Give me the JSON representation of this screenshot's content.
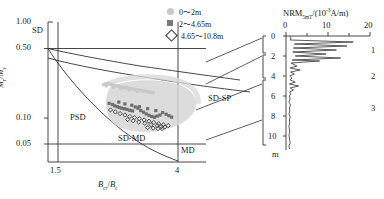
{
  "figure": {
    "panels": [
      "day-plot",
      "nrm-depth-log"
    ]
  },
  "day_plot": {
    "ylabel_m": "M",
    "ylabel_r": "r",
    "ylabel_slash": "/",
    "ylabel_m2": "M",
    "ylabel_s": "s",
    "xlabel_b": "B",
    "xlabel_cr": "cr",
    "xlabel_slash": "/",
    "xlabel_b2": "B",
    "xlabel_c": "c",
    "y_ticks": [
      "1.00",
      "0.50",
      "0.10",
      "0.05"
    ],
    "x_ticks": [
      "1.5",
      "4"
    ],
    "regions": {
      "sd": "SD",
      "psd": "PSD",
      "md": "MD",
      "sd_md": "SD-MD",
      "sd_sp": "SD-SP"
    },
    "ylim": [
      0.03,
      1.25
    ],
    "xlim": [
      1.0,
      5.6
    ],
    "boundary_lines": {
      "y_050": 0.5,
      "y_005": 0.05,
      "x_15": 1.5,
      "x_4": 4.0
    }
  },
  "legend": {
    "items": [
      {
        "marker": "filled-circle",
        "color": "#c9c9c9",
        "label": "0～2m"
      },
      {
        "marker": "filled-square",
        "color": "#7a7a7a",
        "label": "2～4.65m"
      },
      {
        "marker": "open-diamond",
        "color": "#333333",
        "label": "4.65～10.8m"
      }
    ]
  },
  "nrm_panel": {
    "title_main": "NRM",
    "title_sub": "5mT",
    "title_rest_open": "/(10",
    "title_exp": "-3",
    "title_rest_close": "A/m)",
    "x_ticks": [
      "0",
      "10",
      "20"
    ],
    "xlim": [
      0,
      20
    ],
    "depth_ticks": [
      "0",
      "2",
      "4",
      "6",
      "8",
      "10"
    ],
    "depth_unit": "m",
    "ylim": [
      0,
      11.4
    ],
    "zones": [
      {
        "label": "1",
        "depth_range": [
          0,
          2
        ]
      },
      {
        "label": "2",
        "depth_range": [
          2,
          4.65
        ]
      },
      {
        "label": "3",
        "depth_range": [
          4.65,
          10.8
        ]
      }
    ]
  },
  "chart_data": {
    "type": "scatter",
    "title": "",
    "xlabel": "Bcr/Bc",
    "ylabel": "Mr/Ms",
    "xlim": [
      1.0,
      5.6
    ],
    "ylim": [
      0.03,
      1.25
    ],
    "yscale": "log",
    "grid": false,
    "legend_position": "top-right",
    "series": [
      {
        "name": "0～2m",
        "color": "#c9c9c9",
        "marker": "filled-circle",
        "points": [
          [
            2.62,
            0.236
          ],
          [
            2.68,
            0.24
          ],
          [
            2.74,
            0.243
          ],
          [
            2.8,
            0.239
          ],
          [
            2.86,
            0.234
          ],
          [
            2.92,
            0.231
          ],
          [
            2.98,
            0.229
          ],
          [
            3.04,
            0.226
          ],
          [
            3.1,
            0.224
          ],
          [
            3.16,
            0.221
          ],
          [
            3.22,
            0.219
          ],
          [
            3.28,
            0.216
          ],
          [
            3.34,
            0.214
          ],
          [
            3.4,
            0.212
          ],
          [
            3.46,
            0.21
          ],
          [
            3.52,
            0.208
          ],
          [
            3.58,
            0.206
          ],
          [
            3.64,
            0.204
          ],
          [
            3.7,
            0.202
          ],
          [
            3.76,
            0.2
          ],
          [
            3.82,
            0.198
          ],
          [
            3.88,
            0.196
          ],
          [
            3.94,
            0.194
          ],
          [
            4.0,
            0.192
          ],
          [
            4.06,
            0.19
          ],
          [
            2.7,
            0.228
          ],
          [
            2.9,
            0.221
          ],
          [
            3.12,
            0.212
          ],
          [
            3.36,
            0.205
          ],
          [
            3.6,
            0.198
          ]
        ]
      },
      {
        "name": "2～4.65m",
        "color": "#6e6e6e",
        "marker": "filled-square",
        "points": [
          [
            2.78,
            0.143
          ],
          [
            2.88,
            0.139
          ],
          [
            2.94,
            0.134
          ],
          [
            3.02,
            0.131
          ],
          [
            3.08,
            0.128
          ],
          [
            3.14,
            0.126
          ],
          [
            3.22,
            0.124
          ],
          [
            3.3,
            0.122
          ],
          [
            3.38,
            0.119
          ],
          [
            3.46,
            0.117
          ],
          [
            3.54,
            0.13
          ],
          [
            3.62,
            0.126
          ],
          [
            3.7,
            0.118
          ],
          [
            3.78,
            0.113
          ],
          [
            3.86,
            0.108
          ],
          [
            3.94,
            0.104
          ],
          [
            4.02,
            0.101
          ],
          [
            4.1,
            0.099
          ],
          [
            4.18,
            0.102
          ],
          [
            4.26,
            0.105
          ],
          [
            3.06,
            0.148
          ],
          [
            3.24,
            0.141
          ],
          [
            3.44,
            0.136
          ],
          [
            3.66,
            0.131
          ],
          [
            3.9,
            0.124
          ],
          [
            4.14,
            0.118
          ],
          [
            4.34,
            0.112
          ],
          [
            4.44,
            0.107
          ],
          [
            4.52,
            0.103
          ],
          [
            4.6,
            0.099
          ]
        ]
      },
      {
        "name": "4.65～10.8m",
        "color": "#3a3a3a",
        "marker": "open-diamond",
        "points": [
          [
            2.82,
            0.12
          ],
          [
            2.96,
            0.114
          ],
          [
            3.1,
            0.109
          ],
          [
            3.24,
            0.105
          ],
          [
            3.38,
            0.101
          ],
          [
            3.52,
            0.098
          ],
          [
            3.66,
            0.095
          ],
          [
            3.8,
            0.092
          ],
          [
            3.94,
            0.089
          ],
          [
            4.08,
            0.086
          ],
          [
            4.22,
            0.083
          ],
          [
            4.36,
            0.081
          ],
          [
            4.5,
            0.079
          ],
          [
            3.32,
            0.093
          ],
          [
            3.48,
            0.09
          ],
          [
            3.64,
            0.087
          ],
          [
            3.82,
            0.084
          ],
          [
            4.0,
            0.081
          ],
          [
            4.18,
            0.079
          ],
          [
            4.3,
            0.077
          ],
          [
            3.9,
            0.075
          ],
          [
            4.06,
            0.074
          ],
          [
            4.2,
            0.073
          ],
          [
            4.32,
            0.073
          ],
          [
            4.4,
            0.076
          ]
        ]
      }
    ],
    "envelope_note": "gray shaded cluster envelope around data",
    "secondary_chart": {
      "type": "line",
      "name": "NRM5mT vs depth",
      "xlabel": "NRM5mT (10^-3 A/m)",
      "ylabel": "depth (m)",
      "xlim": [
        0,
        20
      ],
      "ylim": [
        0,
        11.4
      ],
      "x": [
        0.9,
        1.2,
        1.0,
        16.0,
        2.0,
        14.5,
        1.8,
        12.0,
        1.6,
        9.5,
        2.2,
        13.0,
        1.5,
        8.0,
        1.2,
        2.6,
        1.0,
        3.4,
        1.1,
        2.0,
        0.9,
        1.4,
        1.0,
        2.2,
        0.8,
        3.0,
        1.0,
        1.8,
        0.9,
        1.2,
        0.8,
        1.0,
        0.7,
        1.1,
        0.8,
        0.9,
        0.7,
        1.0,
        0.8,
        0.9,
        0.7,
        0.8,
        0.9,
        0.7,
        0.8,
        0.9,
        1.0,
        0.8,
        0.7,
        0.9
      ],
      "y": [
        0.0,
        0.2,
        0.4,
        0.6,
        0.8,
        1.0,
        1.2,
        1.4,
        1.6,
        1.8,
        2.0,
        2.2,
        2.4,
        2.5,
        2.7,
        3.0,
        3.2,
        3.4,
        3.6,
        3.8,
        4.0,
        4.2,
        4.4,
        4.6,
        4.8,
        5.0,
        5.2,
        5.4,
        5.6,
        5.8,
        6.0,
        6.3,
        6.6,
        6.9,
        7.2,
        7.5,
        7.8,
        8.1,
        8.4,
        8.7,
        9.0,
        9.3,
        9.6,
        9.9,
        10.2,
        10.5,
        10.7,
        10.9,
        11.1,
        11.3
      ]
    }
  }
}
